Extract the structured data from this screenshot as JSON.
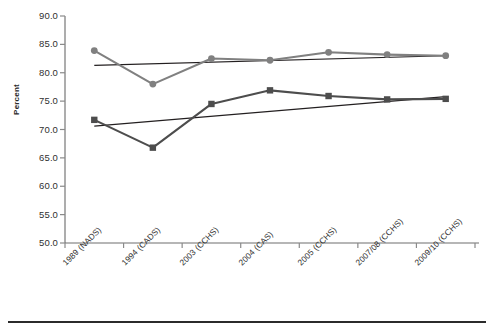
{
  "chart_data": {
    "type": "line",
    "title": "",
    "subtitle": "",
    "xlabel": "",
    "ylabel": "Percent",
    "ylim": [
      50.0,
      90.0
    ],
    "ytick_step": 5.0,
    "ytick_labels": [
      "90.0",
      "85.0",
      "80.0",
      "75.0",
      "70.0",
      "65.0",
      "60.0",
      "55.0",
      "50.0"
    ],
    "ytick_values": [
      90.0,
      85.0,
      80.0,
      75.0,
      70.0,
      65.0,
      60.0,
      55.0,
      50.0
    ],
    "grid": false,
    "legend_position": "none",
    "categories": [
      "1989 (NADS)",
      "1994 (CADS)",
      "2003 (CCHS)",
      "2004 (CAS)",
      "2005 (CCHS)",
      "2007/08 (CCHS)",
      "2009/10 (CCHS)"
    ],
    "series": [
      {
        "name": "series-circle-upper",
        "marker": "circle",
        "color": "#808080",
        "values": [
          83.9,
          78.0,
          82.5,
          82.2,
          83.6,
          83.2,
          83.0
        ]
      },
      {
        "name": "series-square-lower",
        "marker": "square",
        "color": "#4d4d4d",
        "values": [
          71.7,
          66.8,
          74.5,
          76.9,
          75.9,
          75.3,
          75.4
        ]
      }
    ],
    "trendlines": [
      {
        "name": "trendline-upper",
        "for_series": "series-circle-upper",
        "color": "#231f20",
        "start_value": 81.3,
        "end_value": 83.0
      },
      {
        "name": "trendline-lower",
        "for_series": "series-square-lower",
        "color": "#231f20",
        "start_value": 70.6,
        "end_value": 75.8
      }
    ]
  }
}
